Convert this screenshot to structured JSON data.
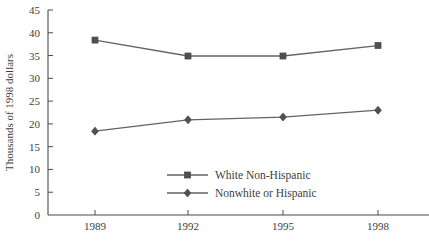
{
  "chart_data": {
    "type": "line",
    "title": "",
    "xlabel": "",
    "ylabel": "Thousands of 1998 dollars",
    "categories": [
      "1989",
      "1992",
      "1995",
      "1998"
    ],
    "x": [
      1989,
      1992,
      1995,
      1998
    ],
    "xlim": [
      1987.5,
      1999.5
    ],
    "ylim": [
      0,
      45
    ],
    "y_ticks": [
      "0",
      "5",
      "10",
      "15",
      "20",
      "25",
      "30",
      "35",
      "40",
      "45"
    ],
    "y_tick_values": [
      0,
      5,
      10,
      15,
      20,
      25,
      30,
      35,
      40,
      45
    ],
    "grid": false,
    "legend_position": "center",
    "series": [
      {
        "name": "White Non-Hispanic",
        "marker": "square",
        "color": "#4f4f4f",
        "values": [
          38.4,
          34.9,
          34.9,
          37.2
        ]
      },
      {
        "name": "Nonwhite or Hispanic",
        "marker": "diamond",
        "color": "#4f4f4f",
        "values": [
          18.4,
          20.9,
          21.5,
          23.0
        ]
      }
    ]
  },
  "legend": {
    "items": [
      {
        "label": "White Non-Hispanic"
      },
      {
        "label": "Nonwhite or Hispanic"
      }
    ]
  },
  "colors": {
    "axis": "#4a4a4a",
    "line": "#636363",
    "marker": "#4f4f4f",
    "text": "#3d3d3d",
    "background": "#ffffff"
  }
}
